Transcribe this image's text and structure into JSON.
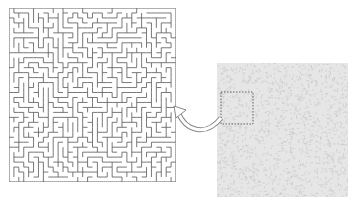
{
  "caption": {
    "text": "(partially cut-off caption text)"
  },
  "figure": {
    "left_panel": {
      "name": "maze-zoomed-view",
      "grid_cols": 34,
      "grid_rows": 35,
      "line_color": "#555555"
    },
    "right_panel": {
      "name": "full-maze-texture",
      "fill_color": "#e6e6e6",
      "noise_color": "#c4c4c4"
    },
    "highlight_box": {
      "x": 4,
      "y": 29,
      "w": 32,
      "h": 32,
      "style": "dashed",
      "color": "#555555"
    },
    "arrow": {
      "from": "highlight-box",
      "to": "maze-zoomed-view",
      "style": "hollow-curved"
    }
  }
}
